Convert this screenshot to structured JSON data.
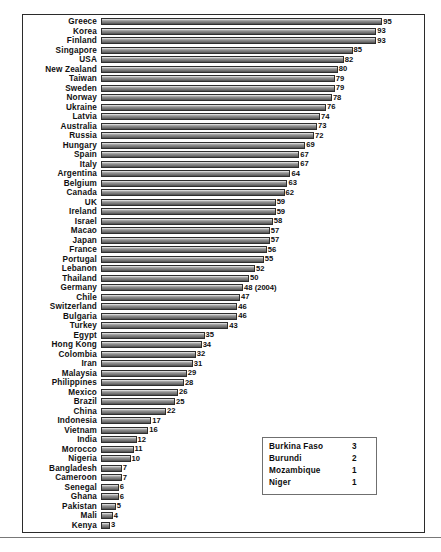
{
  "chart_data": {
    "type": "bar",
    "orientation": "horizontal",
    "title": "",
    "subtitle": "",
    "xlabel": "",
    "ylabel": "",
    "xlim": [
      0,
      100
    ],
    "grid": false,
    "legend_position": "inside-bottom-right",
    "bar_color": "#8d8d8d",
    "bar_edge_color": "#2e2e2e",
    "categories": [
      "Greece",
      "Korea",
      "Finland",
      "Singapore",
      "USA",
      "New Zealand",
      "Taiwan",
      "Sweden",
      "Norway",
      "Ukraine",
      "Latvia",
      "Australia",
      "Russia",
      "Hungary",
      "Spain",
      "Italy",
      "Argentina",
      "Belgium",
      "Canada",
      "UK",
      "Ireland",
      "Israel",
      "Macao",
      "Japan",
      "France",
      "Portugal",
      "Lebanon",
      "Thailand",
      "Germany",
      "Chile",
      "Switzerland",
      "Bulgaria",
      "Turkey",
      "Egypt",
      "Hong Kong",
      "Colombia",
      "Iran",
      "Malaysia",
      "Philippines",
      "Mexico",
      "Brazil",
      "China",
      "Indonesia",
      "Vietnam",
      "India",
      "Morocco",
      "Nigeria",
      "Bangladesh",
      "Cameroon",
      "Senegal",
      "Ghana",
      "Pakistan",
      "Mali",
      "Kenya"
    ],
    "values": [
      95,
      93,
      93,
      85,
      82,
      80,
      79,
      79,
      78,
      76,
      74,
      73,
      72,
      69,
      67,
      67,
      64,
      63,
      62,
      59,
      59,
      58,
      57,
      57,
      56,
      55,
      52,
      50,
      48,
      47,
      46,
      46,
      43,
      35,
      34,
      32,
      31,
      29,
      28,
      26,
      25,
      22,
      17,
      16,
      12,
      11,
      10,
      7,
      7,
      6,
      6,
      5,
      4,
      3
    ],
    "value_labels": [
      "95",
      "93",
      "93",
      "85",
      "82",
      "80",
      "79",
      "79",
      "78",
      "76",
      "74",
      "73",
      "72",
      "69",
      "67",
      "67",
      "64",
      "63",
      "62",
      "59",
      "59",
      "58",
      "57",
      "57",
      "56",
      "55",
      "52",
      "50",
      "48 (2004)",
      "47",
      "46",
      "46",
      "43",
      "35",
      "34",
      "32",
      "31",
      "29",
      "28",
      "26",
      "25",
      "22",
      "17",
      "16",
      "12",
      "11",
      "10",
      "7",
      "7",
      "6",
      "6",
      "5",
      "4",
      "3"
    ],
    "annotations": [
      {
        "category": "Germany",
        "text": "(2004)"
      }
    ],
    "side_table": {
      "rows": [
        {
          "name": "Burkina Faso",
          "value": "3"
        },
        {
          "name": "Burundi",
          "value": "2"
        },
        {
          "name": "Mozambique",
          "value": "1"
        },
        {
          "name": "Niger",
          "value": "1"
        }
      ]
    }
  }
}
